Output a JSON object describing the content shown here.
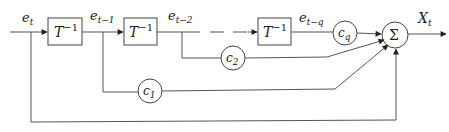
{
  "diagram": {
    "type": "block-diagram",
    "input_signal": "e_t",
    "delay_blocks": [
      {
        "label": "T",
        "exponent": "−1"
      },
      {
        "label": "T",
        "exponent": "−1"
      },
      {
        "label": "T",
        "exponent": "−1"
      }
    ],
    "signals": [
      {
        "base": "e",
        "sub": "t"
      },
      {
        "base": "e",
        "sub": "t−1"
      },
      {
        "base": "e",
        "sub": "t−2"
      },
      {
        "base": "e",
        "sub": "t−q"
      }
    ],
    "coefficients": [
      {
        "base": "c",
        "sub": "q"
      },
      {
        "base": "c",
        "sub": "2"
      },
      {
        "base": "c",
        "sub": "1"
      }
    ],
    "summer": {
      "symbol": "Σ"
    },
    "output": {
      "base": "X",
      "sub": "t"
    },
    "colors": {
      "stroke": "#444444",
      "background": "#ffffff"
    }
  }
}
